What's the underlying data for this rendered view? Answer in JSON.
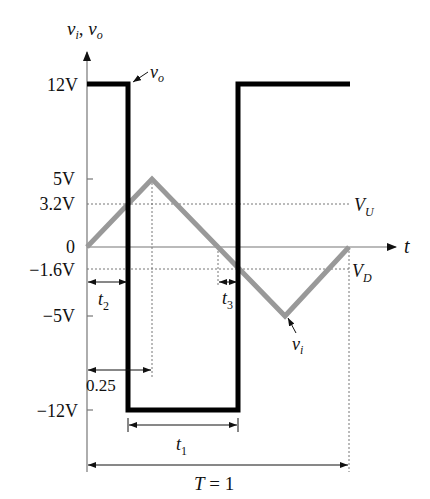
{
  "diagram": {
    "type": "waveform",
    "axes": {
      "y_label_main": "v",
      "y_label_sub1": "i",
      "y_label_sep": ", ",
      "y_label_main2": "v",
      "y_label_sub2": "o",
      "x_label": "t"
    },
    "y_ticks": [
      {
        "label": "12V",
        "value": 12
      },
      {
        "label": "5V",
        "value": 5
      },
      {
        "label": "3.2V",
        "value": 3.2
      },
      {
        "label": "0",
        "value": 0
      },
      {
        "label": "−1.6V",
        "value": -1.6
      },
      {
        "label": "−5V",
        "value": -5
      },
      {
        "label": "−12V",
        "value": -12
      }
    ],
    "signals": {
      "vo": {
        "name": "v",
        "sub": "o",
        "color": "#000000",
        "levels": [
          12,
          -12
        ]
      },
      "vi": {
        "name": "v",
        "sub": "i",
        "color": "#999999",
        "peak": 5,
        "trough": -5
      }
    },
    "thresholds": {
      "upper": {
        "name": "V",
        "sub": "U",
        "value": 3.2
      },
      "lower": {
        "name": "V",
        "sub": "D",
        "value": -1.6
      }
    },
    "intervals": {
      "t1": {
        "name": "t",
        "sub": "1"
      },
      "t2": {
        "name": "t",
        "sub": "2"
      },
      "t3": {
        "name": "t",
        "sub": "3"
      },
      "quarter": {
        "label": "0.25"
      },
      "period": {
        "name": "T",
        "eq": " = 1"
      }
    }
  }
}
